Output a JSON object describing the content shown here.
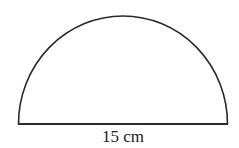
{
  "diagram": {
    "shape": "semicircle",
    "diameter_label": "15 cm",
    "stroke_color": "#2a2a2a",
    "fill_color": "#ffffff",
    "geometry": {
      "base_left_x": 18,
      "base_right_x": 227,
      "base_y": 124,
      "top_y": 16
    }
  }
}
